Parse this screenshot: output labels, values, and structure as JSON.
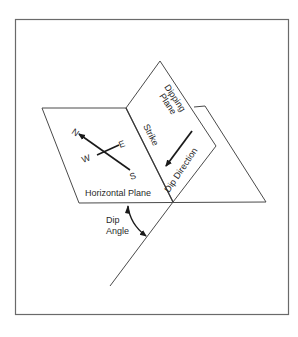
{
  "figure": {
    "type": "geology strike-and-dip diagram",
    "planes": {
      "horizontal": "Horizontal Plane",
      "dipping_line1": "Dipping",
      "dipping_line2": "Plane"
    },
    "labels": {
      "strike": "Strike",
      "dip_direction": "Dip Direction",
      "dip_angle_line1": "Dip",
      "dip_angle_line2": "Angle"
    },
    "compass": {
      "north": "N",
      "south": "S",
      "east": "E",
      "west": "W"
    },
    "colors": {
      "line": "#4a4a4a",
      "frame": "#6a6a6a",
      "text": "#2a2a2a"
    }
  }
}
